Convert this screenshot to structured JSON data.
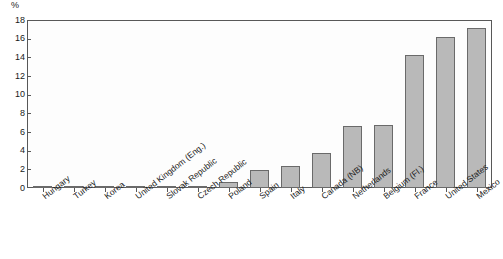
{
  "chart_data": {
    "type": "bar",
    "title": "",
    "subtitle": "",
    "xlabel": "",
    "ylabel": "%",
    "ylim": [
      0,
      18
    ],
    "ytick_step": 2,
    "yticks": [
      "18",
      "16",
      "14",
      "12",
      "10",
      "8",
      "6",
      "4",
      "2",
      "0"
    ],
    "grid": false,
    "legend": "none",
    "bar_color": "#b9b9b9",
    "bar_border_color": "#6a6a6a",
    "axis_color": "#585858",
    "categories": [
      "Hungary",
      "Turkey",
      "Korea",
      "United Kingdom (Eng.)",
      "Slovak Republic",
      "Czech Republic",
      "Poland",
      "Spain",
      "Italy",
      "Canada (NB)",
      "Netherlands",
      "Belgium (Fl.)",
      "France",
      "United States",
      "Mexico"
    ],
    "values": [
      0,
      0,
      0,
      0,
      0.2,
      0.2,
      0.6,
      1.9,
      2.4,
      3.7,
      6.6,
      6.8,
      14.3,
      16.2,
      17.1
    ]
  }
}
